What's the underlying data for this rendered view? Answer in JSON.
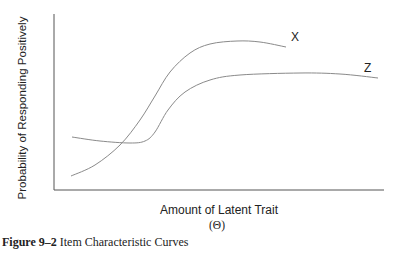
{
  "chart_data": {
    "type": "line",
    "title": "",
    "xlabel": "Amount of Latent Trait",
    "xlabel_symbol": "(Θ)",
    "ylabel": "Probability of Responding Positively",
    "grid": false,
    "ticks": "none",
    "legend": "inline curve labels",
    "series": [
      {
        "name": "X",
        "description": "Steep S-shaped curve starting low, rising sharply, peaking high then slightly declining",
        "points_px": [
          [
            71,
            176
          ],
          [
            95,
            165
          ],
          [
            120,
            145
          ],
          [
            140,
            120
          ],
          [
            155,
            96
          ],
          [
            170,
            72
          ],
          [
            190,
            53
          ],
          [
            210,
            44
          ],
          [
            237,
            41
          ],
          [
            260,
            42
          ],
          [
            286,
            47
          ]
        ]
      },
      {
        "name": "Z",
        "description": "Curve starting moderate, dipping slightly, then rising and leveling off at a plateau",
        "points_px": [
          [
            72,
            137
          ],
          [
            100,
            141
          ],
          [
            130,
            143
          ],
          [
            145,
            141
          ],
          [
            155,
            132
          ],
          [
            168,
            110
          ],
          [
            185,
            92
          ],
          [
            210,
            80
          ],
          [
            240,
            75
          ],
          [
            300,
            73
          ],
          [
            340,
            74
          ],
          [
            378,
            78
          ]
        ]
      }
    ]
  },
  "labels": {
    "curve_x": "X",
    "curve_z": "Z"
  },
  "caption": {
    "figure_number": "Figure 9–2",
    "text": " Item Characteristic Curves"
  }
}
